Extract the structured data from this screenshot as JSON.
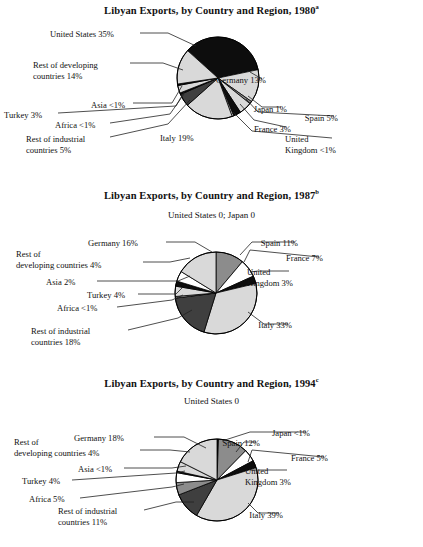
{
  "page": {
    "background": "#ffffff",
    "text_color": "#111111"
  },
  "palette": {
    "black": "#0d0d0d",
    "light_gray": "#d9d9d9",
    "mid_gray": "#8c8c8c",
    "white": "#ffffff",
    "dark_gray": "#3f3f3f",
    "outline": "#000000",
    "leader": "#222222"
  },
  "charts": [
    {
      "id": "chart-1",
      "title": "Libyan Exports, by Country and Region, 1980",
      "title_superscript": "a",
      "topnote": "",
      "center": {
        "x": 218,
        "y": 78
      },
      "radius": 41,
      "start_angle": -48,
      "chart_data": {
        "type": "pie",
        "title": "Libyan Exports, by Country and Region, 1980",
        "unit": "percent of total exports",
        "categories": [
          "United States",
          "Germany",
          "Japan",
          "Spain",
          "France",
          "United Kingdom",
          "Italy",
          "Rest of industrial countries",
          "Africa",
          "Turkey",
          "Asia",
          "Rest of developing countries"
        ],
        "values": [
          35,
          13,
          1,
          5,
          3,
          0.6,
          19,
          5,
          0.6,
          3,
          0.6,
          14
        ],
        "value_labels": [
          "35%",
          "13%",
          "1%",
          "5%",
          "3%",
          "<1%",
          "19%",
          "5%",
          "<1%",
          "3%",
          "<1%",
          "14%"
        ],
        "colors": [
          "#0d0d0d",
          "#d9d9d9",
          "#8c8c8c",
          "#d9d9d9",
          "#0d0d0d",
          "#ffffff",
          "#d9d9d9",
          "#3f3f3f",
          "#0d0d0d",
          "#d9d9d9",
          "#0d0d0d",
          "#d9d9d9"
        ],
        "legend": "callout labels",
        "grid": false
      },
      "labels": [
        {
          "name": "united-states",
          "text": "United States 35%",
          "x": 50,
          "y": 29,
          "align": "l"
        },
        {
          "name": "rest-of-developing-countries",
          "text": "Rest of developing\ncountries 14%",
          "x": 33,
          "y": 60,
          "align": "l"
        },
        {
          "name": "asia",
          "text": "Asia <1%",
          "x": 91,
          "y": 100,
          "align": "l"
        },
        {
          "name": "turkey",
          "text": "Turkey 3%",
          "x": 4,
          "y": 110,
          "align": "l"
        },
        {
          "name": "africa",
          "text": "Africa <1%",
          "x": 55,
          "y": 120,
          "align": "l"
        },
        {
          "name": "rest-of-industrial-countries",
          "text": "Rest of industrial\ncountries 5%",
          "x": 26,
          "y": 134,
          "align": "l"
        },
        {
          "name": "italy",
          "text": "Italy 19%",
          "x": 160,
          "y": 133,
          "align": "l"
        },
        {
          "name": "germany",
          "text": "Germany 13%",
          "x": 266,
          "y": 75,
          "align": "r"
        },
        {
          "name": "japan",
          "text": "Japan 1%",
          "x": 287,
          "y": 104,
          "align": "r"
        },
        {
          "name": "spain",
          "text": "Spain 5%",
          "x": 338,
          "y": 113,
          "align": "r"
        },
        {
          "name": "france",
          "text": "France 3%",
          "x": 291,
          "y": 124,
          "align": "r"
        },
        {
          "name": "united-kingdom",
          "text": "United\nKingdom <1%",
          "x": 336,
          "y": 134,
          "align": "r"
        }
      ],
      "leaders": [
        [
          140,
          33,
          168,
          33,
          196,
          46
        ],
        [
          130,
          63,
          163,
          63,
          183,
          70
        ],
        [
          133,
          103,
          172,
          103,
          182,
          86
        ],
        [
          58,
          113,
          176,
          106,
          184,
          92
        ],
        [
          110,
          123,
          170,
          114,
          184,
          94
        ],
        [
          110,
          137,
          168,
          124,
          190,
          100
        ],
        [
          262,
          79,
          250,
          72
        ],
        [
          281,
          107,
          262,
          107,
          248,
          96
        ],
        [
          334,
          116,
          258,
          112,
          246,
          99
        ],
        [
          286,
          127,
          254,
          120,
          240,
          104
        ],
        [
          332,
          138,
          252,
          131,
          233,
          112
        ]
      ]
    },
    {
      "id": "chart-2",
      "title": "Libyan Exports, by Country and Region, 1987",
      "title_superscript": "b",
      "topnote": "United States 0; Japan 0",
      "center": {
        "x": 216,
        "y": 293
      },
      "radius": 41,
      "start_angle": 0,
      "chart_data": {
        "type": "pie",
        "title": "Libyan Exports, by Country and Region, 1987",
        "unit": "percent of total exports",
        "categories": [
          "United States",
          "Japan",
          "Spain",
          "France",
          "United Kingdom",
          "Italy",
          "Rest of industrial countries",
          "Africa",
          "Turkey",
          "Asia",
          "Rest of developing countries",
          "Germany"
        ],
        "values": [
          0,
          0,
          11,
          7,
          3,
          33,
          18,
          0.6,
          4,
          2,
          4,
          16
        ],
        "value_labels": [
          "0",
          "0",
          "11%",
          "7%",
          "3%",
          "33%",
          "18%",
          "<1%",
          "4%",
          "2%",
          "4%",
          "16%"
        ],
        "colors": [
          "#ffffff",
          "#ffffff",
          "#8c8c8c",
          "#ffffff",
          "#0d0d0d",
          "#d9d9d9",
          "#3f3f3f",
          "#ffffff",
          "#d9d9d9",
          "#0d0d0d",
          "#ffffff",
          "#d9d9d9"
        ],
        "legend": "callout labels",
        "grid": false
      },
      "labels": [
        {
          "name": "germany",
          "text": "Germany 16%",
          "x": 88,
          "y": 238,
          "align": "l"
        },
        {
          "name": "rest-of-developing-countries",
          "text": "Rest of\ndeveloping countries 4%",
          "x": 16,
          "y": 249,
          "align": "l"
        },
        {
          "name": "asia",
          "text": "Asia 2%",
          "x": 46,
          "y": 277,
          "align": "l"
        },
        {
          "name": "turkey",
          "text": "Turkey 4%",
          "x": 87,
          "y": 290,
          "align": "l"
        },
        {
          "name": "africa",
          "text": "Africa <1%",
          "x": 57,
          "y": 303,
          "align": "l"
        },
        {
          "name": "rest-of-industrial-countries",
          "text": "Rest of industrial\ncountries 18%",
          "x": 31,
          "y": 326,
          "align": "l"
        },
        {
          "name": "spain",
          "text": "Spain 11%",
          "x": 298,
          "y": 238,
          "align": "r"
        },
        {
          "name": "france",
          "text": "France 7%",
          "x": 323,
          "y": 253,
          "align": "r"
        },
        {
          "name": "united-kingdom",
          "text": "United\nKingdom 3%",
          "x": 293,
          "y": 267,
          "align": "r"
        },
        {
          "name": "italy",
          "text": "Italy 33%",
          "x": 292,
          "y": 320,
          "align": "r"
        }
      ],
      "leaders": [
        [
          166,
          242,
          195,
          242,
          212,
          252
        ],
        [
          143,
          262,
          170,
          262,
          190,
          258
        ],
        [
          97,
          281,
          178,
          281,
          190,
          276
        ],
        [
          138,
          294,
          176,
          294,
          182,
          288
        ],
        [
          117,
          307,
          172,
          300,
          183,
          295
        ],
        [
          128,
          330,
          178,
          318,
          192,
          310
        ],
        [
          295,
          242,
          252,
          242,
          240,
          255
        ],
        [
          319,
          257,
          250,
          250,
          244,
          262
        ],
        [
          289,
          271,
          258,
          271,
          250,
          272
        ],
        [
          288,
          324,
          264,
          324,
          248,
          312
        ]
      ]
    },
    {
      "id": "chart-3",
      "title": "Libyan Exports, by Country and Region, 1994",
      "title_superscript": "c",
      "topnote": "United States 0",
      "center": {
        "x": 217,
        "y": 480
      },
      "radius": 41,
      "start_angle": 0,
      "chart_data": {
        "type": "pie",
        "title": "Libyan Exports, by Country and Region, 1994",
        "unit": "percent of total exports",
        "categories": [
          "United States",
          "Japan",
          "Spain",
          "France",
          "United Kingdom",
          "Italy",
          "Rest of industrial countries",
          "Africa",
          "Turkey",
          "Asia",
          "Rest of developing countries",
          "Germany"
        ],
        "values": [
          0,
          0.6,
          12,
          5,
          3,
          39,
          11,
          5,
          4,
          0.6,
          4,
          18
        ],
        "value_labels": [
          "0",
          "<1%",
          "12%",
          "5%",
          "3%",
          "39%",
          "11%",
          "5%",
          "4%",
          "<1%",
          "4%",
          "18%"
        ],
        "colors": [
          "#ffffff",
          "#0d0d0d",
          "#8c8c8c",
          "#ffffff",
          "#0d0d0d",
          "#d9d9d9",
          "#3f3f3f",
          "#8c8c8c",
          "#ffffff",
          "#0d0d0d",
          "#d9d9d9",
          "#d9d9d9"
        ],
        "legend": "callout labels",
        "grid": false
      },
      "labels": [
        {
          "name": "germany",
          "text": "Germany 18%",
          "x": 74,
          "y": 433,
          "align": "l"
        },
        {
          "name": "rest-of-developing-countries",
          "text": "Rest of\ndeveloping countries 4%",
          "x": 14,
          "y": 437,
          "align": "l"
        },
        {
          "name": "asia",
          "text": "Asia <1%",
          "x": 78,
          "y": 464,
          "align": "l"
        },
        {
          "name": "turkey",
          "text": "Turkey 4%",
          "x": 22,
          "y": 476,
          "align": "l"
        },
        {
          "name": "africa",
          "text": "Africa 5%",
          "x": 29,
          "y": 494,
          "align": "l"
        },
        {
          "name": "rest-of-industrial-countries",
          "text": "Rest of industrial\ncountries 11%",
          "x": 58,
          "y": 506,
          "align": "l"
        },
        {
          "name": "japan",
          "text": "Japan <1%",
          "x": 310,
          "y": 428,
          "align": "r"
        },
        {
          "name": "spain",
          "text": "Spain 12%",
          "x": 260,
          "y": 438,
          "align": "r"
        },
        {
          "name": "france",
          "text": "France 5%",
          "x": 328,
          "y": 453,
          "align": "r"
        },
        {
          "name": "united-kingdom",
          "text": "United\nKingdom 3%",
          "x": 291,
          "y": 466,
          "align": "r"
        },
        {
          "name": "italy",
          "text": "Italy 39%",
          "x": 283,
          "y": 510,
          "align": "r"
        }
      ],
      "leaders": [
        [
          154,
          437,
          184,
          437,
          206,
          448
        ],
        [
          140,
          450,
          170,
          450,
          190,
          452
        ],
        [
          124,
          468,
          172,
          468,
          186,
          466
        ],
        [
          72,
          480,
          176,
          473,
          185,
          471
        ],
        [
          80,
          498,
          172,
          487,
          184,
          484
        ],
        [
          144,
          510,
          176,
          502,
          194,
          502
        ],
        [
          306,
          432,
          250,
          432,
          222,
          441
        ],
        [
          256,
          442,
          244,
          442,
          236,
          452
        ],
        [
          324,
          457,
          252,
          450,
          248,
          462
        ],
        [
          287,
          470,
          258,
          470,
          250,
          470
        ],
        [
          279,
          513,
          258,
          513,
          248,
          503
        ]
      ]
    }
  ]
}
